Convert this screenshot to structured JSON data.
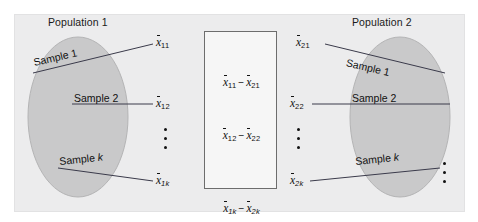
{
  "figure": {
    "type": "statistics-diagram"
  },
  "populations": [
    {
      "id": "population-1",
      "title": "Population 1",
      "samples": [
        {
          "label_prefix": "Sample",
          "label_index": "1",
          "mean_symbol": "x",
          "mean_subscript": "11"
        },
        {
          "label_prefix": "Sample",
          "label_index": "2",
          "mean_symbol": "x",
          "mean_subscript": "12"
        },
        {
          "label_prefix": "Sample",
          "label_index": "k",
          "mean_symbol": "x",
          "mean_subscript": "1k"
        }
      ]
    },
    {
      "id": "population-2",
      "title": "Population 2",
      "samples": [
        {
          "label_prefix": "Sample",
          "label_index": "1",
          "mean_symbol": "x",
          "mean_subscript": "21"
        },
        {
          "label_prefix": "Sample",
          "label_index": "2",
          "mean_symbol": "x",
          "mean_subscript": "22"
        },
        {
          "label_prefix": "Sample",
          "label_index": "k",
          "mean_symbol": "x",
          "mean_subscript": "2k"
        }
      ]
    }
  ],
  "difference_box": {
    "minus_sign": "−",
    "rows": [
      {
        "left_symbol": "x",
        "left_sub": "11",
        "right_symbol": "x",
        "right_sub": "21"
      },
      {
        "left_symbol": "x",
        "left_sub": "12",
        "right_symbol": "x",
        "right_sub": "22"
      },
      {
        "left_symbol": "x",
        "left_sub": "1k",
        "right_symbol": "x",
        "right_sub": "2k"
      }
    ]
  },
  "labels": {
    "sample_1": "Sample 1",
    "sample_2": "Sample 2",
    "sample_k_prefix": "Sample ",
    "sample_k_var": "k"
  },
  "colors": {
    "panel_background": "#ececed",
    "ellipse_fill": "#c9c9ca",
    "ellipse_stroke": "#b4b4b5",
    "box_border": "#6d6d6d",
    "text": "#111111",
    "leader_line": "#3a3a4a"
  }
}
